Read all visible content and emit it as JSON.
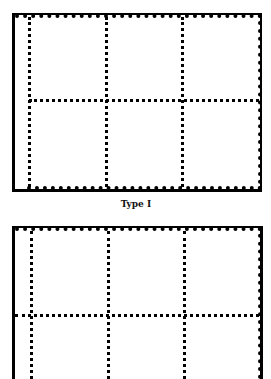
{
  "figure": {
    "diagrams": [
      {
        "id": "type-1",
        "caption": "Type I",
        "columns": 3,
        "rows": 2,
        "frame": {
          "left": 12,
          "top": 13,
          "right": 262,
          "bottom": 191
        },
        "vertical_dividers_x": [
          29,
          106,
          182
        ],
        "horizontal_divider_y": 100,
        "horizontal_divider_starts_at": "first vertical divider"
      },
      {
        "id": "type-2",
        "caption": "",
        "columns": 3,
        "rows": 2,
        "frame": {
          "left": 12,
          "top": 226,
          "right": 262,
          "bottom": 379
        },
        "vertical_dividers_x": [
          31,
          108,
          184
        ],
        "horizontal_divider_y": 315,
        "horizontal_divider_starts_at": "left border"
      }
    ],
    "colors": {
      "ink": "#000000",
      "background": "#ffffff"
    }
  }
}
